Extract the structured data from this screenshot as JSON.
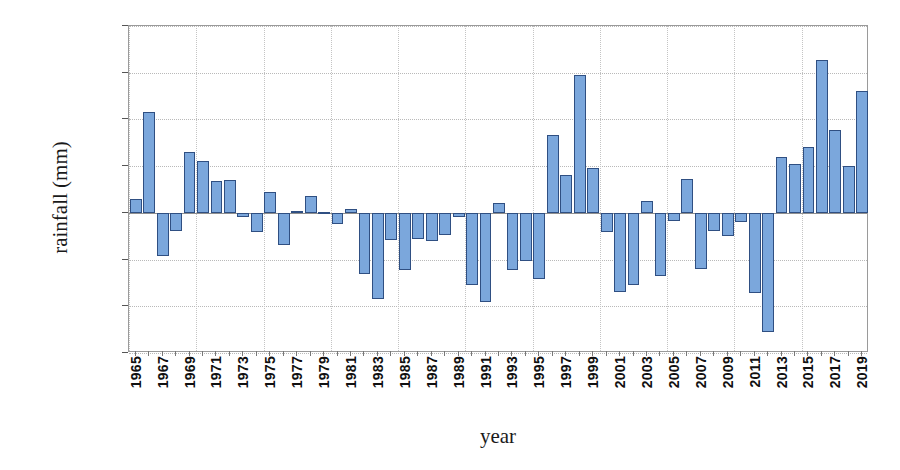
{
  "chart_data": {
    "type": "bar",
    "title": "",
    "xlabel": "year",
    "ylabel": "rainfall (mm)",
    "ylim": [
      -300.0,
      400.0
    ],
    "ytick_step": 100,
    "ytick_labels": [
      "400.0",
      "300.0",
      "200.0",
      "100.0",
      "0.0",
      "-100.0",
      "-200.0",
      "-300.0"
    ],
    "ytick_values": [
      400,
      300,
      200,
      100,
      0,
      -100,
      -200,
      -300
    ],
    "grid": true,
    "legend": "none",
    "xtick_label_step": 2,
    "bar_fill_color": "#7ba7dc",
    "bar_border_color": "#2f4f82",
    "categories": [
      "1965",
      "1966",
      "1967",
      "1968",
      "1969",
      "1970",
      "1971",
      "1972",
      "1973",
      "1974",
      "1975",
      "1976",
      "1977",
      "1978",
      "1979",
      "1980",
      "1981",
      "1982",
      "1983",
      "1984",
      "1985",
      "1986",
      "1987",
      "1988",
      "1989",
      "1990",
      "1991",
      "1992",
      "1993",
      "1994",
      "1995",
      "1996",
      "1997",
      "1998",
      "1999",
      "2000",
      "2001",
      "2002",
      "2003",
      "2004",
      "2005",
      "2006",
      "2007",
      "2008",
      "2009",
      "2010",
      "2011",
      "2012",
      "2013",
      "2014",
      "2015",
      "2016",
      "2017",
      "2018",
      "2019"
    ],
    "values": [
      30,
      215,
      -93,
      -38,
      130,
      112,
      68,
      70,
      -8,
      -42,
      45,
      -68,
      4,
      37,
      2,
      -23,
      9,
      -130,
      -185,
      -58,
      -123,
      -55,
      -60,
      -48,
      -8,
      -155,
      -190,
      22,
      -122,
      -103,
      -142,
      167,
      80,
      296,
      95,
      -42,
      -170,
      -155,
      25,
      -135,
      -18,
      73,
      -120,
      -38,
      -50,
      -20,
      -172,
      -255,
      120,
      105,
      142,
      328,
      177,
      101,
      260
    ],
    "values_visible_labels": [
      "1965",
      "1967",
      "1969",
      "1971",
      "1973",
      "1975",
      "1977",
      "1979",
      "1981",
      "1983",
      "1985",
      "1987",
      "1989",
      "1991",
      "1993",
      "1995",
      "1997",
      "1999",
      "2001",
      "2003",
      "2005",
      "2007",
      "2009",
      "2011",
      "2013",
      "2015",
      "2017",
      "2019"
    ]
  }
}
